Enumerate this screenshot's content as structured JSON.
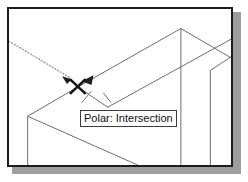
{
  "app": {
    "type": "cad-drawing-viewport",
    "description": "AutoCAD style isometric wireframe drawing with polar tracking snap"
  },
  "viewport": {
    "background_color": "#ffffff",
    "border_color": "#1c1c1c",
    "shadow_color": "#9e9e9e",
    "width": 226,
    "height": 160
  },
  "tooltip": {
    "text": "Polar: Intersection",
    "background_color": "#ffffff",
    "border_color": "#3c3c3c",
    "text_color": "#101010"
  },
  "snap_marker": {
    "name": "intersection-snap-marker",
    "glyph": "X",
    "x": 70,
    "y": 80,
    "color": "#1a1a1a"
  },
  "tracking_line": {
    "name": "polar-tracking-line",
    "style": "dotted",
    "color": "#8a8a8a",
    "from_x": 2,
    "from_y": 40,
    "to_x": 66,
    "to_y": 77
  },
  "geometry": {
    "line_color": "#6b6b6b",
    "line_width": 1,
    "lines": [
      {
        "name": "ridge-left-upper",
        "x1": 70,
        "y1": 80,
        "x2": 175,
        "y2": 20
      },
      {
        "name": "ridge-apex-vertical",
        "x1": 175,
        "y1": 20,
        "x2": 175,
        "y2": 158
      },
      {
        "name": "ridge-right-upper",
        "x1": 175,
        "y1": 20,
        "x2": 226,
        "y2": 50
      },
      {
        "name": "eave-right-diagonal",
        "x1": 100,
        "y1": 101,
        "x2": 226,
        "y2": 33
      },
      {
        "name": "eave-cross-right",
        "x1": 205,
        "y1": 62,
        "x2": 226,
        "y2": 48
      },
      {
        "name": "gable-left-down",
        "x1": 70,
        "y1": 80,
        "x2": 19,
        "y2": 110
      },
      {
        "name": "gable-right-down",
        "x1": 70,
        "y1": 80,
        "x2": 101,
        "y2": 101
      },
      {
        "name": "wall-left-vertical",
        "x1": 19,
        "y1": 110,
        "x2": 19,
        "y2": 158
      },
      {
        "name": "wall-base-diagonal",
        "x1": 19,
        "y1": 110,
        "x2": 128,
        "y2": 158
      },
      {
        "name": "viewport-right-vertical",
        "x1": 205,
        "y1": 62,
        "x2": 205,
        "y2": 158
      }
    ]
  },
  "arrows": [
    {
      "name": "tracking-arrowhead",
      "x": 66,
      "y": 77,
      "angle": 30
    },
    {
      "name": "snap-arrowhead",
      "x": 82,
      "y": 76,
      "angle": 150
    }
  ],
  "leaders": [
    {
      "name": "tooltip-leader-left",
      "x1": 75,
      "y1": 101,
      "x2": 85,
      "y2": 86
    },
    {
      "name": "tooltip-leader-right",
      "x1": 103,
      "y1": 101,
      "x2": 113,
      "y2": 86
    }
  ]
}
